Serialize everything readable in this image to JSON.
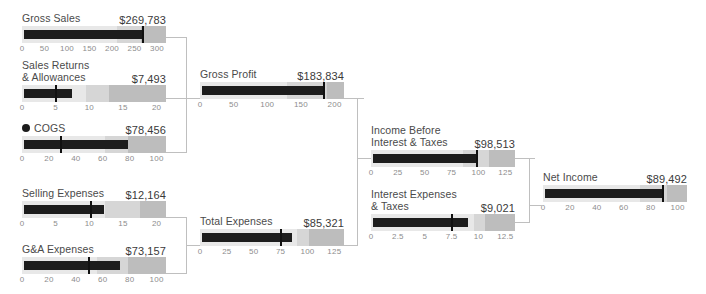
{
  "chart_data": {
    "type": "bar",
    "subtype": "bullet-chart-waterfall",
    "xlabel": "",
    "ylabel": "",
    "grid": false,
    "legend": "none",
    "units": "thousands of US dollars",
    "categories": [
      "Gross Sales",
      "Sales Returns & Allowances",
      "COGS",
      "Gross Profit",
      "Selling Expenses",
      "G&A Expenses",
      "Total Expenses",
      "Income Before Interest & Taxes",
      "Interest Expenses & Taxes",
      "Net Income"
    ],
    "values": [
      269783,
      7493,
      78456,
      183834,
      12164,
      73157,
      85321,
      98513,
      9021,
      89492
    ],
    "series": [
      {
        "name": "Actual",
        "values": [
          269.783,
          7.493,
          78.456,
          183.834,
          12.164,
          73.157,
          85.321,
          98.513,
          9.021,
          89.492
        ]
      }
    ]
  },
  "charts": [
    {
      "id": "gross-sales",
      "label": "Gross Sales",
      "label_lines": [
        "Gross Sales"
      ],
      "value": "$269,783",
      "value_num": 269.783,
      "marker": 269.783,
      "axis_max": 320,
      "ticks": [
        "0",
        "50",
        "100",
        "150",
        "200",
        "250",
        "300"
      ],
      "tick_values": [
        0,
        50,
        100,
        150,
        200,
        250,
        300
      ],
      "bands": [
        210,
        265,
        320
      ],
      "bullet_dot": false
    },
    {
      "id": "sales-returns-allowances",
      "label": "Sales Returns & Allowances",
      "label_lines": [
        "Sales Returns",
        "& Allowances"
      ],
      "value": "$7,493",
      "value_num": 7.493,
      "marker": 5.0,
      "axis_max": 21.4,
      "ticks": [
        "0",
        "5",
        "10",
        "15",
        "20"
      ],
      "tick_values": [
        0,
        5,
        10,
        15,
        20
      ],
      "bands": [
        9.5,
        13.0,
        21.4
      ],
      "bullet_dot": false
    },
    {
      "id": "cogs",
      "label": "COGS",
      "label_lines": [
        "COGS"
      ],
      "value": "$78,456",
      "value_num": 78.456,
      "marker": 29.0,
      "axis_max": 107,
      "ticks": [
        "0",
        "20",
        "40",
        "60",
        "80",
        "100"
      ],
      "tick_values": [
        0,
        20,
        40,
        60,
        80,
        100
      ],
      "bands": [
        62,
        79,
        107
      ],
      "bullet_dot": true
    },
    {
      "id": "gross-profit",
      "label": "Gross Profit",
      "label_lines": [
        "Gross Profit"
      ],
      "value": "$183,834",
      "value_num": 183.834,
      "marker": 183.834,
      "axis_max": 214,
      "ticks": [
        "0",
        "50",
        "100",
        "150",
        "200"
      ],
      "tick_values": [
        0,
        50,
        100,
        150,
        200
      ],
      "bands": [
        130,
        188,
        214
      ],
      "bullet_dot": false
    },
    {
      "id": "selling-expenses",
      "label": "Selling Expenses",
      "label_lines": [
        "Selling Expenses"
      ],
      "value": "$12,164",
      "value_num": 12.164,
      "marker": 10.2,
      "axis_max": 21.4,
      "ticks": [
        "0",
        "5",
        "10",
        "15",
        "20"
      ],
      "tick_values": [
        0,
        5,
        10,
        15,
        20
      ],
      "bands": [
        12.4,
        17.6,
        21.4
      ],
      "bullet_dot": false
    },
    {
      "id": "ga-expenses",
      "label": "G&A Expenses",
      "label_lines": [
        "G&A Expenses"
      ],
      "value": "$73,157",
      "value_num": 73.157,
      "marker": 50.0,
      "axis_max": 107,
      "ticks": [
        "0",
        "20",
        "40",
        "60",
        "80",
        "100"
      ],
      "tick_values": [
        0,
        20,
        40,
        60,
        80,
        100
      ],
      "bands": [
        56,
        79,
        107
      ],
      "bullet_dot": false
    },
    {
      "id": "total-expenses",
      "label": "Total Expenses",
      "label_lines": [
        "Total Expenses"
      ],
      "value": "$85,321",
      "value_num": 85.321,
      "marker": 75.0,
      "axis_max": 134,
      "ticks": [
        "0",
        "25",
        "50",
        "75",
        "100",
        "125"
      ],
      "tick_values": [
        0,
        25,
        50,
        75,
        100,
        125
      ],
      "bands": [
        90,
        101,
        134
      ],
      "bullet_dot": false
    },
    {
      "id": "income-before-interest-taxes",
      "label": "Income Before Interest & Taxes",
      "label_lines": [
        "Income Before",
        "Interest & Taxes"
      ],
      "value": "$98,513",
      "value_num": 98.513,
      "marker": 98.513,
      "axis_max": 134,
      "ticks": [
        "0",
        "25",
        "50",
        "75",
        "100",
        "125"
      ],
      "tick_values": [
        0,
        25,
        50,
        75,
        100,
        125
      ],
      "bands": [
        86,
        110,
        134
      ],
      "bullet_dot": false
    },
    {
      "id": "interest-expenses-taxes",
      "label": "Interest Expenses & Taxes",
      "label_lines": [
        "Interest Expenses",
        "& Taxes"
      ],
      "value": "$9,021",
      "value_num": 9.021,
      "marker": 7.5,
      "axis_max": 13.4,
      "ticks": [
        "0",
        "2.5",
        "5",
        "7.5",
        "10",
        "12.5"
      ],
      "tick_values": [
        0,
        2.5,
        5,
        7.5,
        10,
        12.5
      ],
      "bands": [
        9.6,
        10.6,
        13.4
      ],
      "bullet_dot": false
    },
    {
      "id": "net-income",
      "label": "Net Income",
      "label_lines": [
        "Net Income"
      ],
      "value": "$89,492",
      "value_num": 89.492,
      "marker": 89.492,
      "axis_max": 107,
      "ticks": [
        "0",
        "20",
        "40",
        "60",
        "80",
        "100"
      ],
      "tick_values": [
        0,
        20,
        40,
        60,
        80,
        100
      ],
      "bands": [
        72,
        92,
        107
      ],
      "bullet_dot": false
    }
  ],
  "colors": {
    "measure": "#1d1d1d",
    "marker": "#111111",
    "band_light": "#e8e8e8",
    "band_mid": "#d6d6d6",
    "band_dark": "#bdbdbd",
    "connector": "#bfbfbf",
    "label_text": "#4a4a4a",
    "value_text": "#3a3a3a",
    "tick_text": "#8d8d8d",
    "background": "#ffffff"
  }
}
